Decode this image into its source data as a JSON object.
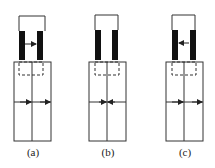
{
  "figure": {
    "panels": [
      {
        "id": "a",
        "label": "(a)",
        "x": 14,
        "top_arrow": "right",
        "bottom_arrows": "right"
      },
      {
        "id": "b",
        "label": "(b)",
        "x": 89,
        "top_arrow": "none",
        "bottom_arrows": "inward"
      },
      {
        "id": "c",
        "label": "(c)",
        "x": 166,
        "top_arrow": "left",
        "bottom_arrows": "right"
      }
    ]
  },
  "colors": {
    "stroke": "#333333",
    "bar": "#111111",
    "background": "#ffffff"
  }
}
